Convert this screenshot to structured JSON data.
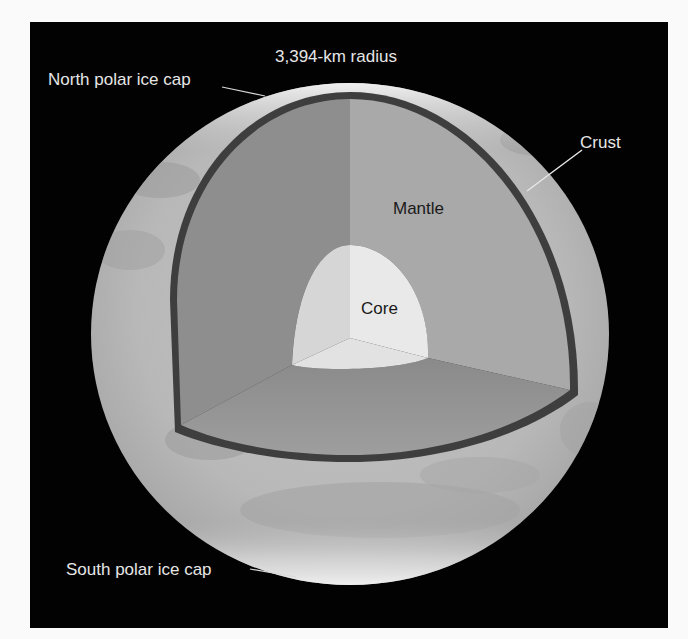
{
  "diagram": {
    "labels": {
      "radius": "3,394-km radius",
      "north_cap": "North polar ice cap",
      "south_cap": "South polar ice cap",
      "crust": "Crust",
      "mantle": "Mantle",
      "core": "Core"
    },
    "colors": {
      "background": "#020202",
      "page": "#fafafa",
      "surface": "#bdbdbd",
      "ice_cap": "#f2f2f2",
      "crust_line": "#3e3e3e",
      "mantle_left": "#8e8e8e",
      "mantle_right": "#a9a9a9",
      "mantle_floor": "#929292",
      "core_right": "#e9e9e9",
      "core_left": "#d6d6d6",
      "label_light": "#e6e6e6",
      "label_dark": "#1a1a1a"
    }
  }
}
